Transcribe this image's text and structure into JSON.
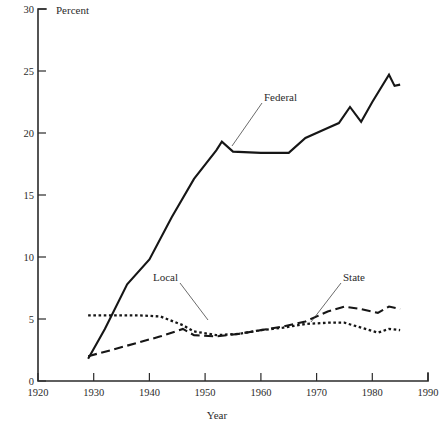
{
  "chart_data": {
    "type": "line",
    "title": "",
    "xlabel": "Year",
    "ylabel": "Percent",
    "xlim": [
      1920,
      1990
    ],
    "ylim": [
      0,
      30
    ],
    "xticks": [
      1920,
      1930,
      1940,
      1950,
      1960,
      1970,
      1980,
      1990
    ],
    "xtick_labels": [
      "1920",
      "1930",
      "1940",
      "1950",
      "1960",
      "1970",
      "1980",
      "1990"
    ],
    "yticks": [
      0,
      5,
      10,
      15,
      20,
      25,
      30
    ],
    "ytick_labels": [
      "0",
      "5",
      "10",
      "15",
      "20",
      "25",
      "30"
    ],
    "grid": false,
    "legend": "inline-labels",
    "series": [
      {
        "name": "Federal",
        "style": "solid",
        "label_text": "Federal",
        "points": [
          [
            1929,
            1.8
          ],
          [
            1932,
            4.2
          ],
          [
            1936,
            7.8
          ],
          [
            1940,
            9.8
          ],
          [
            1944,
            13.2
          ],
          [
            1948,
            16.3
          ],
          [
            1952,
            18.6
          ],
          [
            1953,
            19.3
          ],
          [
            1955,
            18.5
          ],
          [
            1960,
            18.4
          ],
          [
            1965,
            18.4
          ],
          [
            1968,
            19.6
          ],
          [
            1972,
            20.4
          ],
          [
            1974,
            20.8
          ],
          [
            1976,
            22.1
          ],
          [
            1978,
            20.9
          ],
          [
            1980,
            22.5
          ],
          [
            1983,
            24.7
          ],
          [
            1984,
            23.8
          ],
          [
            1985,
            23.9
          ]
        ]
      },
      {
        "name": "State",
        "style": "dashed",
        "label_text": "State",
        "points": [
          [
            1929,
            2.0
          ],
          [
            1934,
            2.6
          ],
          [
            1938,
            3.1
          ],
          [
            1942,
            3.6
          ],
          [
            1946,
            4.2
          ],
          [
            1948,
            3.7
          ],
          [
            1952,
            3.6
          ],
          [
            1956,
            3.8
          ],
          [
            1960,
            4.1
          ],
          [
            1964,
            4.4
          ],
          [
            1968,
            4.8
          ],
          [
            1972,
            5.6
          ],
          [
            1975,
            6.0
          ],
          [
            1978,
            5.8
          ],
          [
            1981,
            5.5
          ],
          [
            1983,
            6.0
          ],
          [
            1985,
            5.8
          ]
        ]
      },
      {
        "name": "Local",
        "style": "dotted",
        "label_text": "Local",
        "points": [
          [
            1929,
            5.3
          ],
          [
            1934,
            5.3
          ],
          [
            1938,
            5.3
          ],
          [
            1942,
            5.2
          ],
          [
            1946,
            4.5
          ],
          [
            1948,
            4.0
          ],
          [
            1952,
            3.7
          ],
          [
            1956,
            3.8
          ],
          [
            1960,
            4.1
          ],
          [
            1964,
            4.3
          ],
          [
            1968,
            4.6
          ],
          [
            1972,
            4.7
          ],
          [
            1975,
            4.7
          ],
          [
            1978,
            4.3
          ],
          [
            1981,
            3.9
          ],
          [
            1983,
            4.2
          ],
          [
            1985,
            4.1
          ]
        ]
      }
    ],
    "annotations": [
      {
        "text": "Federal",
        "value": "Federal"
      },
      {
        "text": "State",
        "value": "State"
      },
      {
        "text": "Local",
        "value": "Local"
      }
    ]
  }
}
